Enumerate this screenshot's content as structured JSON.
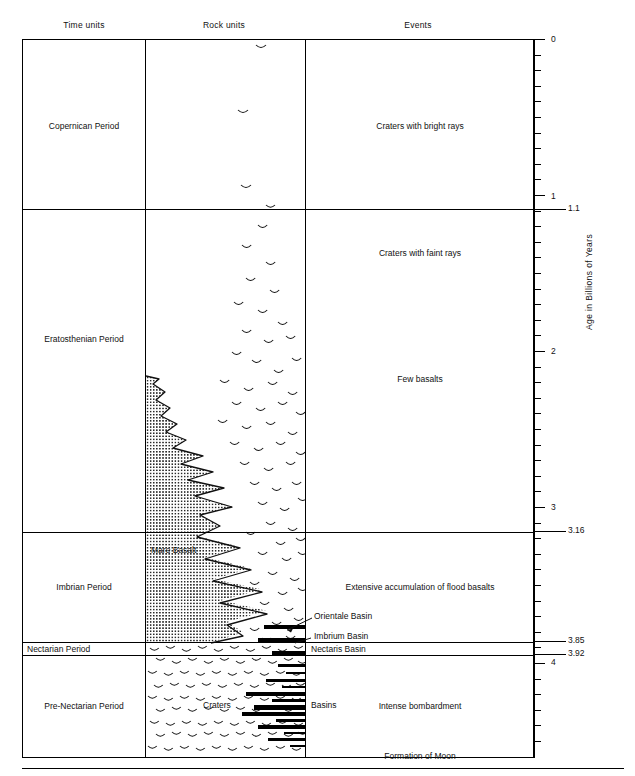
{
  "figure": {
    "type": "stratigraphic-timescale",
    "axis_title": "Age in Billions of Years"
  },
  "columns": [
    {
      "id": "time-units",
      "header": "Time units"
    },
    {
      "id": "rock-units",
      "header": "Rock units"
    },
    {
      "id": "events",
      "header": "Events"
    }
  ],
  "time_units": [
    {
      "name": "Copernican Period",
      "top_age": 0.0,
      "bottom_age": 1.1
    },
    {
      "name": "Eratosthenian Period",
      "top_age": 1.1,
      "bottom_age": 3.16
    },
    {
      "name": "Imbrian Period",
      "top_age": 3.16,
      "bottom_age": 3.85
    },
    {
      "name": "Nectarian Period",
      "top_age": 3.85,
      "bottom_age": 3.92
    },
    {
      "name": "Pre-Nectarian Period",
      "top_age": 3.92,
      "bottom_age": 4.6
    }
  ],
  "events": [
    {
      "label": "Craters with bright rays",
      "period": "Copernican Period"
    },
    {
      "label": "Craters with faint rays",
      "period": "Eratosthenian Period"
    },
    {
      "label": "Few basalts",
      "period": "Eratosthenian Period"
    },
    {
      "label": "Extensive accumulation of flood basalts",
      "period": "Imbrian Period"
    },
    {
      "label": "Intense bombardment",
      "period": "Pre-Nectarian Period"
    },
    {
      "label": "Formation of Moon",
      "period": "Pre-Nectarian Period"
    }
  ],
  "rock_unit_labels": [
    {
      "label": "Mare Basalt"
    },
    {
      "label": "Craters"
    },
    {
      "label": "Basins"
    }
  ],
  "basin_markers": [
    {
      "label": "Orientale Basin",
      "age": 3.8,
      "leader": true
    },
    {
      "label": "Imbrium Basin",
      "age": 3.85,
      "leader": true
    },
    {
      "label": "Nectaris Basin",
      "age": 3.92,
      "leader": false
    }
  ],
  "axis": {
    "min": 0,
    "max": 4.55,
    "direction": "top-to-bottom",
    "minor_tick_interval": 0.1,
    "major_ticks": [
      "0",
      "1",
      "2",
      "3",
      "4"
    ],
    "boundary_ticks": [
      "1.1",
      "3.16",
      "3.85",
      "3.92"
    ],
    "all_labels": [
      "0",
      "1",
      "1.1",
      "2",
      "3",
      "3.16",
      "3.85",
      "3.92",
      "4"
    ]
  },
  "chart_data": {
    "type": "table",
    "ylabel": "Age in Billions of Years",
    "ylim": [
      0,
      4.55
    ],
    "grid": false,
    "legend": "none",
    "categories": [
      "Time units",
      "Rock units",
      "Events"
    ],
    "rows": [
      {
        "time_unit": "Copernican Period",
        "top_age": 0.0,
        "bottom_age": 1.1,
        "rock_units": "Craters (sparse)",
        "events": "Craters with bright rays"
      },
      {
        "time_unit": "Eratosthenian Period",
        "top_age": 1.1,
        "bottom_age": 3.16,
        "rock_units": "Craters; Mare Basalt (upper part)",
        "events": "Craters with faint rays; Few basalts"
      },
      {
        "time_unit": "Imbrian Period",
        "top_age": 3.16,
        "bottom_age": 3.85,
        "rock_units": "Mare Basalt; Craters",
        "events": "Extensive accumulation of flood basalts"
      },
      {
        "time_unit": "Nectarian Period",
        "top_age": 3.85,
        "bottom_age": 3.92,
        "rock_units": "Craters; Basins",
        "events": "Nectaris Basin"
      },
      {
        "time_unit": "Pre-Nectarian Period",
        "top_age": 3.92,
        "bottom_age": 4.6,
        "rock_units": "Craters; Basins",
        "events": "Intense bombardment; Formation of Moon"
      }
    ],
    "boundary_ages": [
      0,
      1.1,
      3.16,
      3.85,
      3.92
    ],
    "axis_tick_labels": [
      "0",
      "1",
      "1.1",
      "2",
      "3",
      "3.16",
      "3.85",
      "3.92",
      "4"
    ]
  }
}
